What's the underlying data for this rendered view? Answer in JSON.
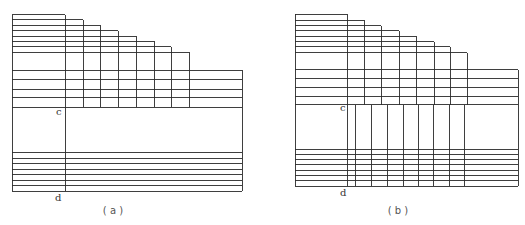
{
  "figure": {
    "line_color": "#2a2a2a",
    "panels": [
      {
        "id": "a",
        "caption": "( a )",
        "caption_pos": [
          113,
          214
        ],
        "labels": [
          {
            "text": "c",
            "x": 56,
            "y": 115
          },
          {
            "text": "d",
            "x": 55,
            "y": 201
          }
        ],
        "outer": {
          "left": 12,
          "right": 242,
          "top_bottom": 191
        },
        "steps": {
          "left": 12,
          "cols_x": [
            65,
            83,
            100,
            118,
            136,
            154,
            171,
            189
          ],
          "tops_y": [
            14.5,
            19.5,
            25,
            30.5,
            36,
            41,
            46.5,
            52
          ],
          "bottom_y": 107
        },
        "upper_band": {
          "right": 242,
          "h_lines_y": [
            70,
            79.5,
            89,
            97.5,
            107
          ]
        },
        "divider_cd": {
          "x": 65,
          "y1": 107,
          "y2": 191
        },
        "lower_band": {
          "h_lines_y": [
            152.5,
            158,
            163.5,
            169,
            174.5,
            180,
            185.5,
            191
          ]
        },
        "lower_verticals_x": []
      },
      {
        "id": "b",
        "caption": "( b )",
        "caption_pos": [
          398,
          214
        ],
        "labels": [
          {
            "text": "c",
            "x": 340,
            "y": 111
          },
          {
            "text": "d",
            "x": 340,
            "y": 196
          }
        ],
        "outer": {
          "left": 295,
          "right": 518,
          "top_bottom": 186
        },
        "steps": {
          "left": 295,
          "cols_x": [
            347,
            364,
            381,
            399,
            416,
            434,
            450,
            467
          ],
          "tops_y": [
            14,
            20,
            25.5,
            30.5,
            36,
            41.5,
            46.5,
            52.5
          ],
          "bottom_y": 104.5
        },
        "upper_band": {
          "right": 518,
          "h_lines_y": [
            69.5,
            78.5,
            87.5,
            96.5,
            104.5
          ]
        },
        "divider_cd": {
          "x": 347,
          "y1": 104.5,
          "y2": 186
        },
        "lower_band": {
          "h_lines_y": [
            149,
            154,
            159.5,
            164.5,
            170,
            175.5,
            180.5,
            186
          ]
        },
        "lower_verticals_x": [
          355,
          371,
          387,
          403,
          418,
          433,
          449,
          464
        ]
      }
    ]
  }
}
